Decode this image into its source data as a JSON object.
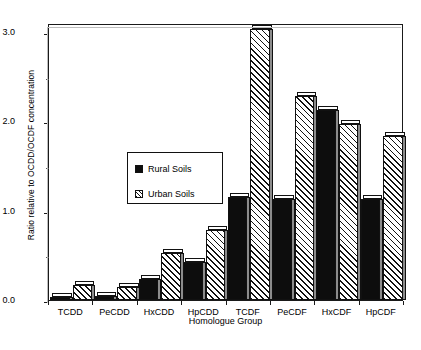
{
  "chart_data": {
    "type": "bar",
    "title": "",
    "xlabel": "Homologue Group",
    "ylabel": "Ratio relative to OCDD/OCDF concentration",
    "ylim": [
      0.0,
      3.1
    ],
    "yticks": [
      "0.0",
      "1.0",
      "2.0",
      "3.0"
    ],
    "ytick_values": [
      0.0,
      1.0,
      2.0,
      3.0
    ],
    "grid": false,
    "legend_position": "inside-upper-left",
    "categories": [
      "TCDD",
      "PeCDD",
      "HxCDD",
      "HpCDD",
      "TCDF",
      "PeCDF",
      "HxCDF",
      "HpCDF"
    ],
    "series": [
      {
        "name": "Rural Soils",
        "style": "solid-black",
        "color": "#0d0d0d",
        "values": [
          0.03,
          0.04,
          0.23,
          0.42,
          1.15,
          1.13,
          2.13,
          1.13
        ]
      },
      {
        "name": "Urban Soils",
        "style": "diagonal-hatch",
        "color": "#ffffff",
        "values": [
          0.17,
          0.15,
          0.53,
          0.78,
          3.03,
          2.28,
          1.97,
          1.83
        ]
      }
    ]
  },
  "legend": {
    "entries": [
      {
        "label": "Rural Soils",
        "swatch": "solid-black-swatch"
      },
      {
        "label": "Urban Soils",
        "swatch": "hatched-swatch"
      }
    ]
  }
}
